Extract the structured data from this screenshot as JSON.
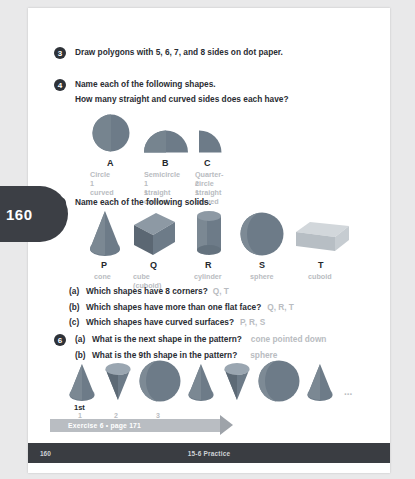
{
  "page": {
    "number_tab": "160",
    "footer_page": "160",
    "footer_title": "15-6 Practice",
    "banner_label": "Exercise 6 • page 171",
    "ellipsis": "..."
  },
  "colors": {
    "shape_fill": "#6d7b88",
    "shape_fill_light": "#9aa6b1",
    "shape_fill_dark": "#55606b",
    "cuboid_light": "#c3c8cd",
    "answer_text": "#b9bcc1",
    "body_text": "#2a2d33",
    "bullet": "#2e3238",
    "banner": "#b9bdc2",
    "footer_bar": "#3a3d42",
    "tab": "#3c3f45"
  },
  "questions": [
    {
      "number": "3",
      "lines": [
        "Draw polygons with 5, 6, 7, and 8 sides on dot paper."
      ]
    },
    {
      "number": "4",
      "lines": [
        "Name each of the following shapes.",
        "How many straight and curved sides does each have?"
      ],
      "shapes": [
        {
          "letter": "A",
          "name": "Circle",
          "detail": [
            "1 curved"
          ],
          "icon": "circle-shape"
        },
        {
          "letter": "B",
          "name": "Semicircle",
          "detail": [
            "1 straight",
            "1 curved"
          ],
          "icon": "semicircle-shape"
        },
        {
          "letter": "C",
          "name": "Quarter-circle",
          "detail": [
            "2 straight",
            "1 curved"
          ],
          "icon": "quarter-circle-shape"
        }
      ]
    },
    {
      "number": "5",
      "lines": [
        "Name each of the following solids."
      ],
      "solids": [
        {
          "letter": "P",
          "name": "cone",
          "icon": "cone-solid"
        },
        {
          "letter": "Q",
          "name": "cube (cuboid)",
          "icon": "cube-solid"
        },
        {
          "letter": "R",
          "name": "cylinder",
          "icon": "cylinder-solid"
        },
        {
          "letter": "S",
          "name": "sphere",
          "icon": "sphere-solid"
        },
        {
          "letter": "T",
          "name": "cuboid",
          "icon": "cuboid-solid"
        }
      ],
      "parts": [
        {
          "tag": "(a)",
          "question": "Which shapes have 8 corners?",
          "answer": "Q, T"
        },
        {
          "tag": "(b)",
          "question": "Which shapes have more than one flat face?",
          "answer": "Q, R, T"
        },
        {
          "tag": "(c)",
          "question": "Which shapes have curved surfaces?",
          "answer": "P, R, S"
        }
      ]
    },
    {
      "number": "6",
      "parts": [
        {
          "tag": "(a)",
          "question": "What is the next shape in the pattern?",
          "answer": "cone pointed down"
        },
        {
          "tag": "(b)",
          "question": "What is the 9th shape in the pattern?",
          "answer": "sphere"
        }
      ],
      "pattern": {
        "sequence": [
          "cone-up",
          "cone-down",
          "sphere",
          "cone-up",
          "cone-down",
          "sphere",
          "cone-up"
        ],
        "position_labels": [
          "1st",
          "1",
          "2",
          "3"
        ]
      }
    }
  ]
}
